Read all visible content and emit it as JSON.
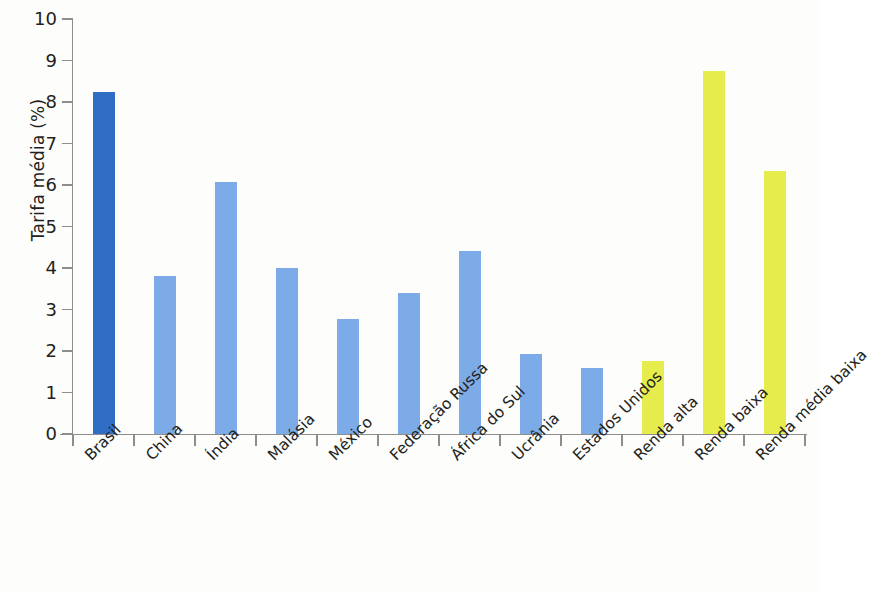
{
  "chart_data": {
    "type": "bar",
    "title": "",
    "subtitle": "",
    "xlabel": "",
    "ylabel": "Tarifa média (%)",
    "ylim": [
      0,
      10
    ],
    "ytick_labels": [
      "0",
      "1",
      "2",
      "3",
      "4",
      "5",
      "6",
      "7",
      "8",
      "9",
      "10"
    ],
    "ytick_values": [
      0,
      1,
      2,
      3,
      4,
      5,
      6,
      7,
      8,
      9,
      10
    ],
    "grid": false,
    "legend": "none",
    "categories": [
      "Brasil",
      "China",
      "Índia",
      "Malásia",
      "México",
      "Federação Russa",
      "África do Sul",
      "Ucrânia",
      "Estados Unidos",
      "Renda alta",
      "Renda baixa",
      "Renda média baixa"
    ],
    "values": [
      8.24,
      3.81,
      6.08,
      3.99,
      2.78,
      3.41,
      4.41,
      1.92,
      1.6,
      1.76,
      8.74,
      6.33
    ],
    "bar_colors": [
      "#2f6ec4",
      "#7cabe8",
      "#7cabe8",
      "#7cabe8",
      "#7cabe8",
      "#7cabe8",
      "#7cabe8",
      "#7cabe8",
      "#7cabe8",
      "#e6ec4c",
      "#e6ec4c",
      "#e6ec4c"
    ],
    "colors": {
      "highlight_bar": "#2f6ec4",
      "country_bar": "#7cabe8",
      "aggregate_bar": "#e6ec4c",
      "axis": "#8d8d8d",
      "text": "#231f20",
      "background": "#fdfdfc"
    }
  }
}
